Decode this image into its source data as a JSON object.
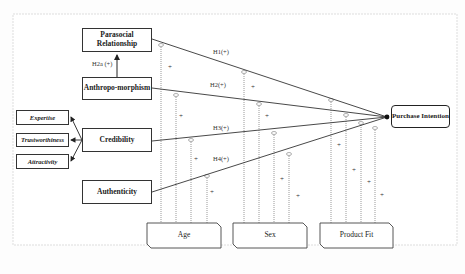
{
  "diagram": {
    "constructs": {
      "parasocial": "Parasocial Relationship",
      "anthropomorphism": "Anthropo-morphism",
      "credibility": "Credibility",
      "authenticity": "Authenticity",
      "purchase_intention": "Purchase Intention"
    },
    "credibility_dimensions": [
      "Expertise",
      "Trustworthiness",
      "Attractivity"
    ],
    "moderators": [
      "Age",
      "Sex",
      "Product Fit"
    ],
    "hypotheses": {
      "h1": "H1(+)",
      "h2": "H2(+)",
      "h2a": "H2a (+)",
      "h3": "H3(+)",
      "h4": "H4(+)"
    },
    "moderation_sign": "+",
    "colors": {
      "line": "#333333",
      "dotted": "#999999",
      "box_border": "#333333",
      "background": "#ffffff"
    }
  }
}
